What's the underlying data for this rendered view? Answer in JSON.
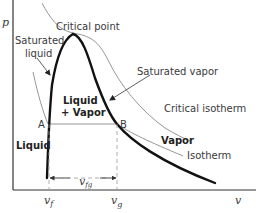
{
  "diagram": {
    "type": "p-v phase diagram",
    "axes": {
      "y_label": "p",
      "x_label": "v"
    },
    "labels": {
      "critical_point": "Critical point",
      "saturated_liquid_line1": "Saturated",
      "saturated_liquid_line2": "liquid",
      "saturated_vapor": "Saturated vapor",
      "critical_isotherm": "Critical  isotherm",
      "liquid_vapor_line1": "Liquid",
      "liquid_vapor_line2": "+ Vapor",
      "liquid": "Liquid",
      "vapor": "Vapor",
      "isotherm": "Isotherm",
      "point_a": "A",
      "point_b": "B"
    },
    "ticks": {
      "v_f_base": "v",
      "v_f_sub": "f",
      "v_g_base": "v",
      "v_g_sub": "g",
      "v_fg_base": "v",
      "v_fg_sub": "fg"
    },
    "colors": {
      "dome": "#111111",
      "isotherm": "#8a8a8a",
      "axis": "#333333",
      "dashed": "#9a9a9a",
      "text": "#3a3a3a"
    }
  }
}
